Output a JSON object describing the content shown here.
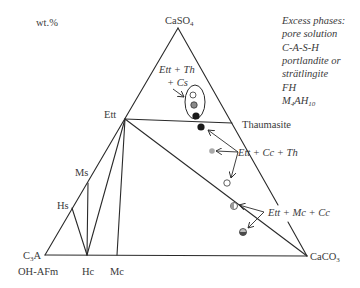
{
  "figure": {
    "units_label": "wt.%",
    "vertices": {
      "top": {
        "base": "CaSO",
        "sub": "4"
      },
      "bottom_right": {
        "base": "CaCO",
        "sub": "3"
      },
      "bottom_left": {
        "base": "C",
        "sub": "3",
        "rest": "A"
      },
      "bottom_left_alt": "OH-AFm"
    },
    "phase_labels": {
      "ett": "Ett",
      "ms": "Ms",
      "hs": "Hs",
      "hc": "Hc",
      "mc": "Mc",
      "thaumasite": "Thaumasite"
    },
    "assemblage_labels": {
      "ett_th_cs_line1": "Ett + Th",
      "ett_th_cs_line2": "+ Cs",
      "ett_cc_th": "Ett + Cc + Th",
      "ett_mc_cc": "Ett + Mc + Cc"
    },
    "excess_phases": {
      "title": "Excess phases:",
      "items": [
        "pore solution",
        "C-A-S-H",
        "portlandite or",
        "strätlingite",
        "FH"
      ],
      "last": {
        "p1": "M",
        "s1": "4",
        "p2": "AH",
        "s2": "10"
      }
    }
  },
  "points": [
    {
      "id": "p1",
      "style": "open"
    },
    {
      "id": "p2",
      "style": "gray"
    },
    {
      "id": "p3",
      "style": "black"
    },
    {
      "id": "p4",
      "style": "black"
    },
    {
      "id": "p5",
      "style": "light-gray"
    },
    {
      "id": "p6",
      "style": "open"
    },
    {
      "id": "p7",
      "style": "half-gray"
    },
    {
      "id": "p8",
      "style": "half-dark"
    }
  ],
  "colors": {
    "line": "#2a2a2a",
    "text": "#3a3a3a",
    "open": "#ffffff",
    "gray": "#8a8a8a",
    "light_gray": "#a8a8a8",
    "black": "#1a1a1a",
    "half_gray": "#9a9a9a",
    "half_dark": "#4a4a4a"
  }
}
